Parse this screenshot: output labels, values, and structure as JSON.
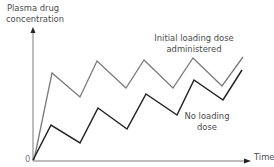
{
  "chart_data": {
    "type": "line",
    "title": "",
    "xlabel": "Time",
    "ylabel": "Plasma drug concentration",
    "origin_label": "0",
    "grid": false,
    "legend_position": "inline annotations",
    "series": [
      {
        "name": "Initial loading dose administered",
        "color": "#7a7a7a",
        "points_px": [
          [
            34,
            160
          ],
          [
            52,
            73
          ],
          [
            80,
            97
          ],
          [
            97,
            61
          ],
          [
            126,
            88
          ],
          [
            144,
            60
          ],
          [
            173,
            88
          ],
          [
            193,
            58
          ],
          [
            222,
            86
          ],
          [
            243,
            57
          ]
        ]
      },
      {
        "name": "No loading dose",
        "color": "#222222",
        "points_px": [
          [
            33,
            160
          ],
          [
            51,
            125
          ],
          [
            80,
            143
          ],
          [
            98,
            108
          ],
          [
            127,
            129
          ],
          [
            146,
            94
          ],
          [
            177,
            115
          ],
          [
            194,
            80
          ],
          [
            223,
            100
          ],
          [
            242,
            70
          ]
        ]
      }
    ],
    "annotations": [
      "Initial loading dose administered",
      "No loading dose"
    ]
  },
  "labels": {
    "ylabel_line1": "Plasma drug",
    "ylabel_line2": "concentration",
    "xlabel": "Time",
    "origin": "0",
    "gray_line1": "Initial loading dose",
    "gray_line2": "administered",
    "black_line1": "No loading",
    "black_line2": "dose"
  },
  "colors": {
    "axis": "#7a7a7a",
    "loading_dose_curve": "#7a7a7a",
    "no_loading_dose_curve": "#222222",
    "text": "#4a4a4a"
  }
}
